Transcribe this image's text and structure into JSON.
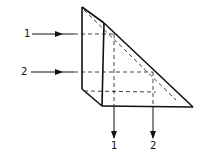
{
  "diagram": {
    "type": "right-angle prism beam path",
    "colors": {
      "line": "#111111",
      "background": "#ffffff"
    },
    "input_beams": [
      {
        "label": "1",
        "y": 34
      },
      {
        "label": "2",
        "y": 72
      }
    ],
    "output_beams": [
      {
        "label": "1",
        "x": 114
      },
      {
        "label": "2",
        "x": 153
      }
    ]
  }
}
